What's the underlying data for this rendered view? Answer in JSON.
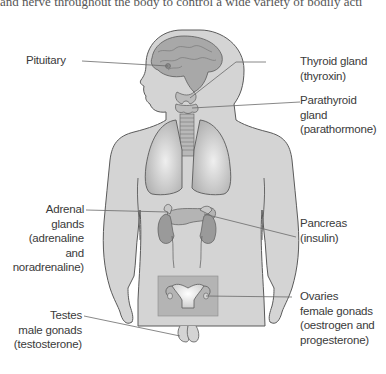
{
  "header": {
    "cropped_text": "and nerve throughout the body to control a wide variety of bodily acti"
  },
  "figure": {
    "colors": {
      "body_fill": "#d4d4d4",
      "body_stroke": "#5a5a5a",
      "organ_fill": "#a8a8a8",
      "organ_highlight": "#e8e8e8",
      "pelvis_box": "#b4b4b4",
      "leader_line": "#6a6a6a",
      "label_text": "#3a3a3a"
    }
  },
  "labels": {
    "pituitary": {
      "lines": [
        "Pituitary"
      ]
    },
    "thyroid": {
      "lines": [
        "Thyroid gland",
        "(thyroxin)"
      ]
    },
    "parathyroid": {
      "lines": [
        "Parathyroid",
        "gland",
        "(parathormone)"
      ]
    },
    "adrenal": {
      "lines": [
        "Adrenal",
        "glands",
        "(adrenaline",
        "and",
        "noradrenaline)"
      ]
    },
    "pancreas": {
      "lines": [
        "Pancreas",
        "(insulin)"
      ]
    },
    "ovaries": {
      "lines": [
        "Ovaries",
        "female gonads",
        "(oestrogen and",
        "progesterone)"
      ]
    },
    "testes": {
      "lines": [
        "Testes",
        "male gonads",
        "(testosterone)"
      ]
    }
  }
}
